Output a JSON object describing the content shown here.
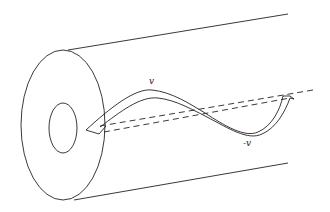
{
  "diagram": {
    "labels": {
      "positive": "v",
      "negative": "-v"
    },
    "colors": {
      "stroke": "#222222",
      "background": "#ffffff"
    }
  }
}
